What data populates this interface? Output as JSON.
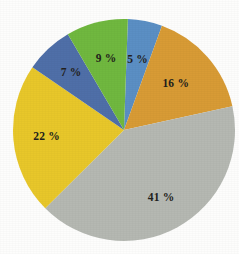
{
  "chart_data": {
    "type": "pie",
    "title": "",
    "subtitle": "",
    "xlabel": "",
    "ylabel": "",
    "legend_position": "none",
    "grid": false,
    "label_suffix": " %",
    "total": 100,
    "start_angle_deg": 2,
    "direction": "clockwise",
    "categories": [
      "Segment 1",
      "Segment 2",
      "Segment 3",
      "Segment 4",
      "Segment 5",
      "Segment 6"
    ],
    "values": [
      5,
      16,
      41,
      22,
      7,
      9
    ],
    "labels": [
      "5 %",
      "16 %",
      "41 %",
      "22 %",
      "7 %",
      "9 %"
    ],
    "colors": [
      "#5B8FC4",
      "#D89B35",
      "#B5B8B2",
      "#E8C72A",
      "#4F6FA8",
      "#70B83F"
    ],
    "slices": [
      {
        "label": "5 %",
        "value": 5,
        "color": "#5B8FC4",
        "label_radius_ratio": 0.64
      },
      {
        "label": "16 %",
        "value": 16,
        "color": "#D89B35",
        "label_radius_ratio": 0.62
      },
      {
        "label": "41 %",
        "value": 41,
        "color": "#B5B8B2",
        "label_radius_ratio": 0.7
      },
      {
        "label": "22 %",
        "value": 22,
        "color": "#E8C72A",
        "label_radius_ratio": 0.7
      },
      {
        "label": "7 %",
        "value": 7,
        "color": "#4F6FA8",
        "label_radius_ratio": 0.7
      },
      {
        "label": "9 %",
        "value": 9,
        "color": "#70B83F",
        "label_radius_ratio": 0.66
      }
    ],
    "geometry": {
      "center_x": 124,
      "center_y": 130,
      "radius": 111
    },
    "background_color": "#fdfdfc",
    "label_text_color": "#231f1c"
  }
}
